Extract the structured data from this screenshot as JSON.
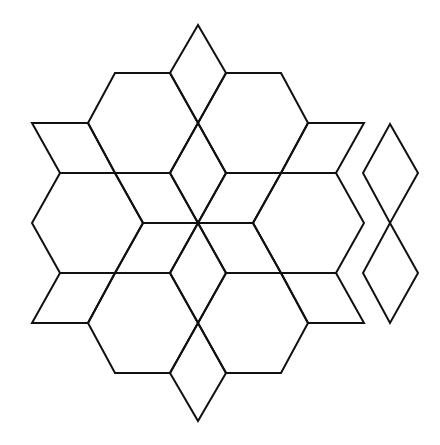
{
  "diagram": {
    "title": "",
    "stroke_color": "#111111",
    "background": "#ffffff",
    "polygons": [
      {
        "name": "rhombus-top",
        "points": "198,25 226,73 198,123 170,73"
      },
      {
        "name": "hexagon-top-left",
        "points": "115,73 170,73 198,123 170,173 115,173 88,123"
      },
      {
        "name": "hexagon-top-right",
        "points": "226,73 281,73 308,123 281,173 226,173 198,123"
      },
      {
        "name": "rhombus-left-top",
        "points": "32,123 88,123 115,173 60,173"
      },
      {
        "name": "rhombus-right-top",
        "points": "308,123 364,123 336,173 281,173"
      },
      {
        "name": "hexagon-left",
        "points": "60,173 115,173 143,223 115,273 60,273 32,223"
      },
      {
        "name": "hexagon-right",
        "points": "281,173 336,173 364,223 336,273 281,273 253,223"
      },
      {
        "name": "star-rhombus-n",
        "points": "198,123 226,173 198,223 170,173"
      },
      {
        "name": "star-rhombus-s",
        "points": "198,223 226,273 198,323 170,273"
      },
      {
        "name": "star-rhombus-ne",
        "points": "226,173 281,173 253,223 198,223"
      },
      {
        "name": "star-rhombus-nw",
        "points": "115,173 170,173 198,223 143,223"
      },
      {
        "name": "star-rhombus-se",
        "points": "198,223 253,223 281,273 226,273"
      },
      {
        "name": "star-rhombus-sw",
        "points": "143,223 198,223 170,273 115,273"
      },
      {
        "name": "rhombus-left-bottom",
        "points": "60,273 115,273 88,323 32,323"
      },
      {
        "name": "rhombus-right-bottom",
        "points": "281,273 336,273 364,323 308,323"
      },
      {
        "name": "hexagon-bottom-left",
        "points": "88,323 115,273 170,273 198,323 170,373 115,373"
      },
      {
        "name": "hexagon-bottom-right",
        "points": "198,323 226,273 281,273 308,323 281,373 226,373"
      },
      {
        "name": "rhombus-bottom",
        "points": "198,323 226,373 198,421 170,373"
      },
      {
        "name": "detached-rhombus-upper",
        "points": "390,124 418,173 390,223 363,173"
      },
      {
        "name": "detached-rhombus-lower",
        "points": "390,223 418,273 390,323 363,273"
      }
    ]
  }
}
